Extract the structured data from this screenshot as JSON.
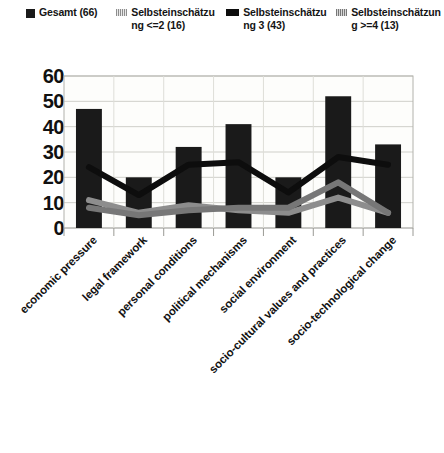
{
  "legend": {
    "entries": [
      {
        "label": "Gesamt (66)",
        "marker": "filled-square-black",
        "color": "#1a1a1a"
      },
      {
        "label": "Selbsteinschätzung <=2 (16)",
        "marker": "hatched-square-light-gray",
        "color": "#8d8d8d"
      },
      {
        "label": "Selbsteinschätzung 3 (43)",
        "marker": "filled-rect-black",
        "color": "#0d0d0d"
      },
      {
        "label": "Selbsteinschätzung >=4 (13)",
        "marker": "hatched-square-mid-gray",
        "color": "#777777"
      }
    ]
  },
  "axes": {
    "y_ticks": [
      "0",
      "10",
      "20",
      "30",
      "40",
      "50",
      "60"
    ]
  },
  "chart_data": {
    "type": "bar",
    "title": "",
    "subtitle": "",
    "xlabel": "",
    "ylabel": "",
    "ylim": [
      0,
      60
    ],
    "ytick_step": 10,
    "grid": true,
    "legend_position": "top",
    "categories": [
      "economic pressure",
      "legal framework",
      "personal conditions",
      "political mechanisms",
      "social environment",
      "socio-cultural values and practices",
      "socio-technological change"
    ],
    "series": [
      {
        "name": "Gesamt (66)",
        "type": "bar",
        "color": "#1a1a1a",
        "values": [
          47,
          20,
          32,
          41,
          20,
          52,
          33
        ]
      },
      {
        "name": "Selbsteinschätzung <=2 (16)",
        "type": "line",
        "color": "#8d8d8d",
        "values": [
          11,
          6,
          9,
          7,
          6,
          12,
          6
        ]
      },
      {
        "name": "Selbsteinschätzung 3 (43)",
        "type": "line",
        "color": "#0d0d0d",
        "values": [
          24,
          13,
          25,
          26,
          14,
          28,
          25
        ]
      },
      {
        "name": "Selbsteinschätzung >=4 (13)",
        "type": "line",
        "color": "#777777",
        "values": [
          8,
          5,
          7,
          8,
          8,
          18,
          6
        ]
      }
    ]
  }
}
